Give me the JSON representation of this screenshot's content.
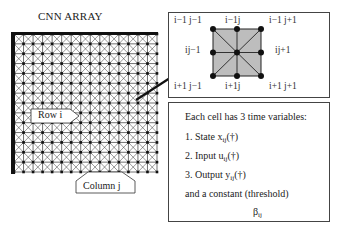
{
  "title": "CNN ARRAY",
  "grid": {
    "columns": 15,
    "rows": 14
  },
  "callouts": {
    "row": "Row i",
    "column": "Column j"
  },
  "neighborhood": {
    "labels": {
      "top_left": "i−1 j−1",
      "top_center": "i−1j",
      "top_right": "i−1 j+1",
      "mid_left": "ij−1",
      "mid_right": "ij+1",
      "bottom_left": "i+1 j−1",
      "bottom_center": "i+1j",
      "bottom_right": "i+1 j+1"
    },
    "fill_color": "#bdbdbd"
  },
  "info": {
    "heading": "Each cell has 3 time variables:",
    "items": [
      {
        "prefix": "1. State x",
        "sub": "ij",
        "suffix": "(†)"
      },
      {
        "prefix": "2. Input u",
        "sub": "ij",
        "suffix": "(†)"
      },
      {
        "prefix": "3. Output y",
        "sub": "ij",
        "suffix": "(†)"
      }
    ],
    "constant_text": "and a constant (threshold)",
    "constant_symbol": "β",
    "constant_sub": "ij"
  }
}
